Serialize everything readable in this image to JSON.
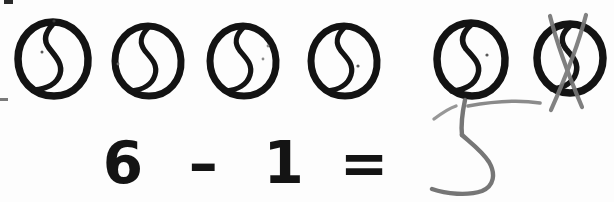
{
  "worksheet": {
    "kind": "handwritten-math-worksheet",
    "background_color": "#fdfdfd",
    "ink_color": "#141414",
    "pencil_color": "#6f6f6f",
    "width": 614,
    "height": 202
  },
  "objects": {
    "label": "drawn-circles-row",
    "total_count": 6,
    "crossed_out_count": 1,
    "remaining_count": 5,
    "shape_name": "circle-with-s-curve",
    "items": [
      {
        "index": 1,
        "cx": 53,
        "cy": 59,
        "rx": 35,
        "ry": 37,
        "crossed_out": false
      },
      {
        "index": 2,
        "cx": 148,
        "cy": 61,
        "rx": 33,
        "ry": 35,
        "crossed_out": false
      },
      {
        "index": 3,
        "cx": 243,
        "cy": 61,
        "rx": 33,
        "ry": 35,
        "crossed_out": false
      },
      {
        "index": 4,
        "cx": 344,
        "cy": 61,
        "rx": 33,
        "ry": 35,
        "crossed_out": false
      },
      {
        "index": 5,
        "cx": 471,
        "cy": 59,
        "rx": 35,
        "ry": 36,
        "crossed_out": false
      },
      {
        "index": 6,
        "cx": 570,
        "cy": 58,
        "rx": 34,
        "ry": 35,
        "crossed_out": true
      }
    ]
  },
  "cross_out": {
    "label": "pencil-x-over-last-circle",
    "color": "#7a7a7a",
    "stroke_width": 4
  },
  "equation": {
    "label": "subtraction-equation",
    "minuend": "6",
    "operator": "–",
    "subtrahend": "1",
    "equals": "=",
    "printed": true
  },
  "answer": {
    "label": "handwritten-answer",
    "value": "5",
    "color": "#6f6f6f",
    "written_in": "pencil"
  },
  "artifacts": {
    "top_left_mark": "scan-speck",
    "left_edge_mark": "scan-dash"
  }
}
